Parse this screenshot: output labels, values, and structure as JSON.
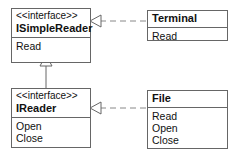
{
  "diagram": {
    "type": "uml-class-diagram",
    "classes": [
      {
        "id": "isimplereader",
        "stereotype": "<<interface>>",
        "name": "ISimpleReader",
        "operations": [
          "Read"
        ]
      },
      {
        "id": "ireader",
        "stereotype": "<<interface>>",
        "name": "IReader",
        "operations": [
          "Open",
          "Close"
        ]
      },
      {
        "id": "terminal",
        "stereotype": "",
        "name": "Terminal",
        "operations": [
          "Read"
        ]
      },
      {
        "id": "file",
        "stereotype": "",
        "name": "File",
        "operations": [
          "Read",
          "Open",
          "Close"
        ]
      }
    ],
    "relations": [
      {
        "from": "IReader",
        "to": "ISimpleReader",
        "kind": "generalization"
      },
      {
        "from": "Terminal",
        "to": "ISimpleReader",
        "kind": "realization"
      },
      {
        "from": "File",
        "to": "IReader",
        "kind": "realization"
      }
    ],
    "colors": {
      "line": "#666666",
      "dash": "#888888",
      "text": "#111111"
    }
  }
}
